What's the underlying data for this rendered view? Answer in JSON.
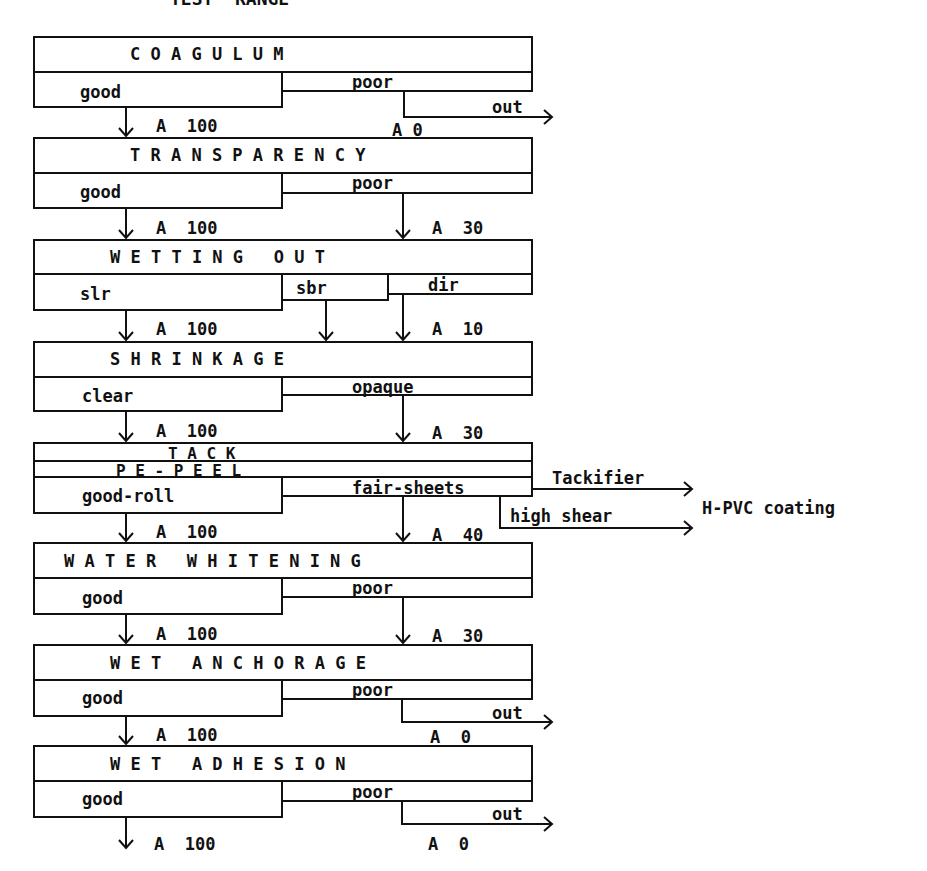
{
  "page": {
    "title_partial": "TEST  RANGE"
  },
  "stages": [
    {
      "name": "C O A G U L U M",
      "options": {
        "left": "good",
        "right": "poor"
      },
      "out": "out",
      "values": {
        "left": "A  100",
        "right": "A 0"
      }
    },
    {
      "name": "T R A N S P A R E N C Y",
      "options": {
        "left": "good",
        "right": "poor"
      },
      "values": {
        "left": "A  100",
        "right": "A  30"
      }
    },
    {
      "name": "W E T T I N G   O U T",
      "options": {
        "left": "slr",
        "middle": "sbr",
        "right": "dir"
      },
      "values": {
        "left": "A  100",
        "right": "A  10"
      }
    },
    {
      "name": "S H R I N K A G E",
      "options": {
        "left": "clear",
        "right": "opaque"
      },
      "values": {
        "left": "A  100",
        "right": "A  30"
      }
    },
    {
      "name": "T A C K",
      "subname": "P E - P E E L",
      "options": {
        "left": "good-roll",
        "right": "fair-sheets"
      },
      "branches": {
        "tackifier": "Tackifier",
        "high_shear": "high shear",
        "target": "H-PVC coating"
      },
      "values": {
        "left": "A  100",
        "right": "A  40"
      }
    },
    {
      "name": "W A T E R   W H I T E N I N G",
      "options": {
        "left": "good",
        "right": "poor"
      },
      "values": {
        "left": "A  100",
        "right": "A  30"
      }
    },
    {
      "name": "W E T   A N C H O R A G E",
      "options": {
        "left": "good",
        "right": "poor"
      },
      "out": "out",
      "values": {
        "left": "A  100",
        "right": "A  0"
      }
    },
    {
      "name": "W E T   A D H E S I O N",
      "options": {
        "left": "good",
        "right": "poor"
      },
      "out": "out",
      "values": {
        "left": "A  100",
        "right": "A  0"
      }
    }
  ],
  "colors": {
    "line": "#111111",
    "background": "#ffffff"
  }
}
